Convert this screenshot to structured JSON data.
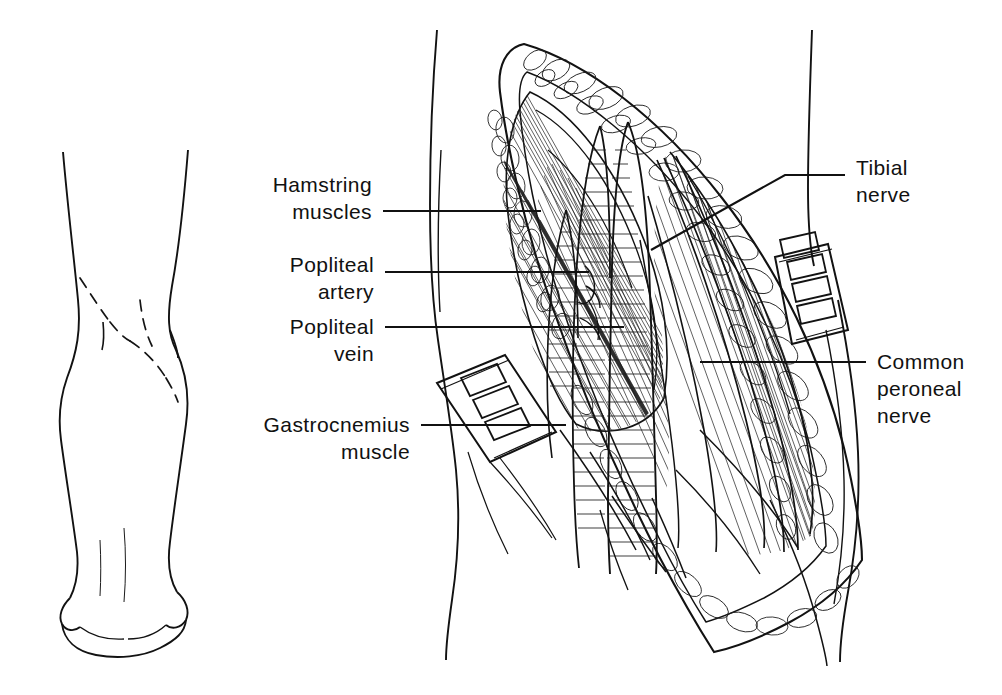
{
  "figure": {
    "type": "medical-illustration",
    "style": "black-and-white pen-and-ink line drawing",
    "background_color": "#ffffff",
    "ink_color": "#121212"
  },
  "panels": [
    {
      "id": "orientation-figure",
      "name": "posterior-leg-orientation-drawing",
      "description": "Posterior view outline of a leg from thigh to heel with a dashed S-shaped skin incision marked across the popliteal fossa",
      "features": [
        "leg-outline",
        "calf-contour",
        "heel",
        "dashed-incision-line"
      ]
    },
    {
      "id": "dissection-figure",
      "name": "popliteal-fossa-dissection",
      "description": "Opened lens-shaped surgical wound of the popliteal fossa with lobulated subcutaneous fat margins, retractors, muscles, vessels and nerves",
      "features": [
        "skin-edge",
        "subcutaneous-fat",
        "retractor-left",
        "retractor-right",
        "muscle-bellies",
        "neurovascular-bundle"
      ]
    }
  ],
  "labels": [
    {
      "id": "hamstring-muscles",
      "text_lines": [
        "Hamstring",
        "muscles"
      ],
      "side": "left",
      "leader": "horizontal",
      "points_to": "hamstring muscle belly at upper-left of wound"
    },
    {
      "id": "popliteal-artery",
      "text_lines": [
        "Popliteal",
        "artery"
      ],
      "side": "left",
      "leader": "horizontal",
      "points_to": "popliteal artery in the depth of the fossa"
    },
    {
      "id": "popliteal-vein",
      "text_lines": [
        "Popliteal",
        "vein"
      ],
      "side": "left",
      "leader": "horizontal",
      "points_to": "popliteal vein lying superficial to the artery"
    },
    {
      "id": "gastrocnemius-muscle",
      "text_lines": [
        "Gastrocnemius",
        "muscle"
      ],
      "side": "left",
      "leader": "horizontal",
      "points_to": "medial head of gastrocnemius at lower-left of wound"
    },
    {
      "id": "tibial-nerve",
      "text_lines": [
        "Tibial",
        "nerve"
      ],
      "side": "right",
      "leader": "bent",
      "points_to": "tibial nerve in the centre of the popliteal fossa"
    },
    {
      "id": "common-peroneal-nerve",
      "text_lines": [
        "Common",
        "peroneal",
        "nerve"
      ],
      "side": "right",
      "leader": "horizontal",
      "points_to": "common peroneal nerve along the lateral border of the fossa"
    }
  ],
  "instruments": [
    {
      "id": "retractor-left",
      "name": "slotted-retractor-blade",
      "slots": 3,
      "position": "lower-left wound margin"
    },
    {
      "id": "retractor-right",
      "name": "slotted-retractor-blade",
      "slots": 4,
      "position": "upper-right wound margin"
    }
  ]
}
